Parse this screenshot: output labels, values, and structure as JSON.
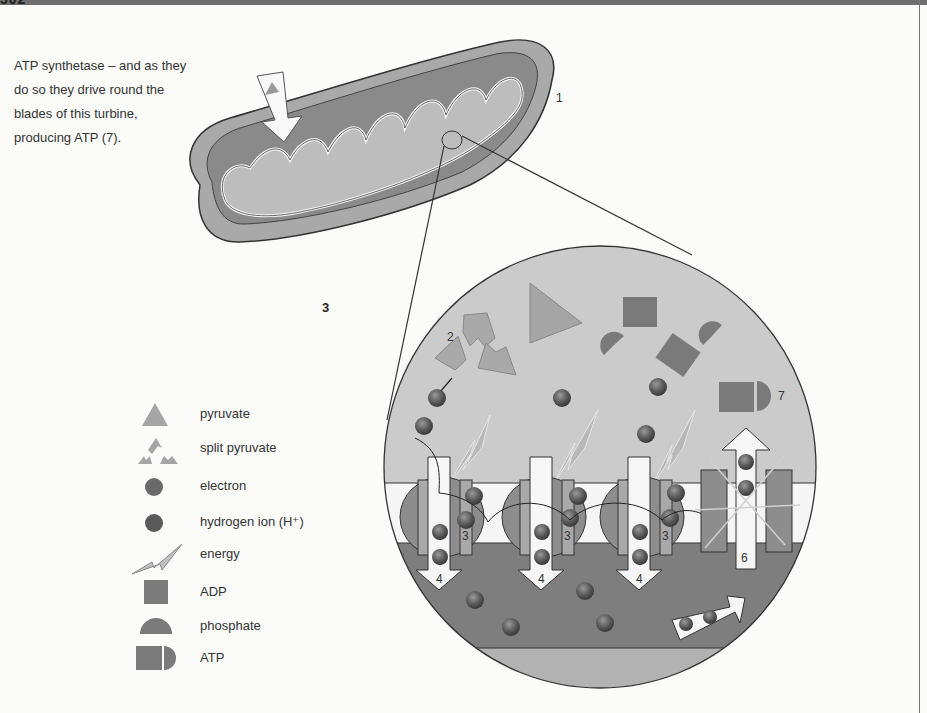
{
  "header": {
    "page_number_partial": "302",
    "band_color": "#6e6e6e"
  },
  "caption": {
    "lines": [
      "ATP synthetase – and as they",
      "do so they drive round the",
      "blades of this turbine,",
      "producing ATP (7)."
    ]
  },
  "diagram": {
    "labels": {
      "mitochondrion": "1",
      "split_pyruvate": "2",
      "standalone_step": "3",
      "carrier_a": "3",
      "carrier_b": "3",
      "carrier_c": "3",
      "pump_a": "4",
      "pump_b": "4",
      "pump_c": "4",
      "synthase": "6",
      "atp": "7"
    },
    "colors": {
      "matrix_light": "#c9c9c9",
      "membrane": "#f4f4f4",
      "intermembrane_dark": "#7d7d7d",
      "lower_band": "#b0b0b0",
      "molecule": "#8f8f8f",
      "ion": "#5c5c5c",
      "outline": "#2b2b2b"
    }
  },
  "legend": {
    "items": [
      {
        "icon": "pyruvate-triangle-icon",
        "label": "pyruvate"
      },
      {
        "icon": "split-pyruvate-icon",
        "label": "split pyruvate"
      },
      {
        "icon": "electron-icon",
        "label": "electron"
      },
      {
        "icon": "hydrogen-ion-icon",
        "label": "hydrogen ion (H⁺)"
      },
      {
        "icon": "energy-bolt-icon",
        "label": "energy"
      },
      {
        "icon": "adp-square-icon",
        "label": "ADP"
      },
      {
        "icon": "phosphate-semicircle-icon",
        "label": "phosphate"
      },
      {
        "icon": "atp-icon",
        "label": "ATP"
      }
    ]
  }
}
